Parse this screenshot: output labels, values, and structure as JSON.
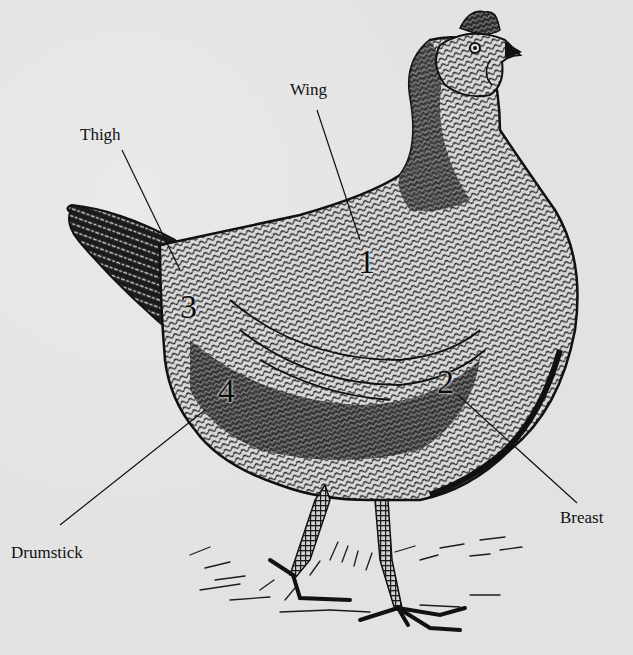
{
  "diagram": {
    "background_color": "#e4e4e4",
    "ink_color": "#111111",
    "labels": [
      {
        "id": "wing",
        "text": "Wing",
        "number": "1"
      },
      {
        "id": "breast",
        "text": "Breast",
        "number": "2"
      },
      {
        "id": "thigh",
        "text": "Thigh",
        "number": "3"
      },
      {
        "id": "drumstick",
        "text": "Drumstick",
        "number": "4"
      }
    ]
  }
}
